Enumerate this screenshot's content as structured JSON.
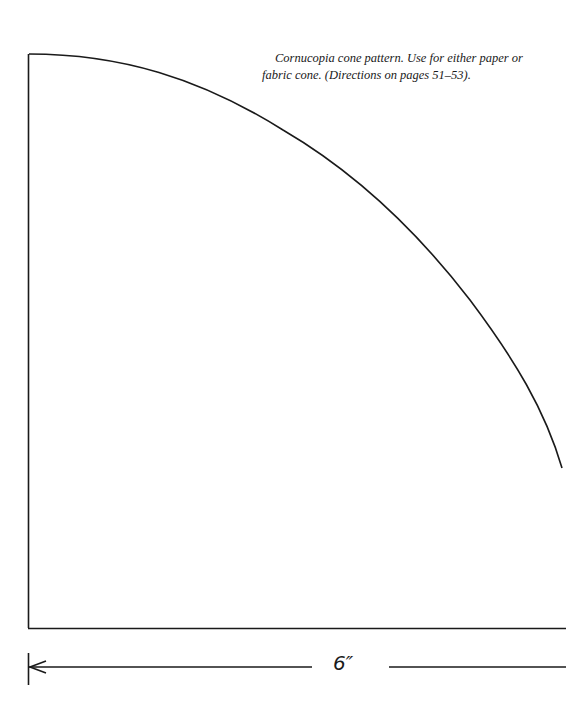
{
  "caption": {
    "line1": "Cornucopia cone pattern. Use for either paper or",
    "line2": "fabric cone. (Directions on pages 51–53)."
  },
  "dimension": {
    "label": "6″"
  },
  "colors": {
    "ink": "#1a1a1a",
    "paper": "#ffffff"
  }
}
